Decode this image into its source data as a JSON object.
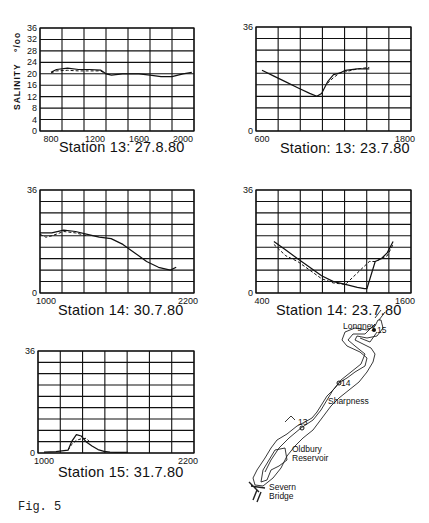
{
  "figure_caption": "Fig. 5",
  "y_axis_label": "SALINITY ‰o",
  "y_axis_unit": "o/oo",
  "chart_data": [
    {
      "type": "line",
      "title": "Station 13: 27.8.80",
      "ylabel": "SALINITY o/oo",
      "xlabel": "",
      "ylim": [
        0,
        36
      ],
      "yticks": [
        0,
        4,
        8,
        12,
        16,
        20,
        24,
        28,
        32,
        36
      ],
      "xlim": [
        700,
        2100
      ],
      "xticks": [
        800,
        1200,
        1600,
        2000
      ],
      "grid": true,
      "series": [
        {
          "name": "solid",
          "x": [
            800,
            850,
            950,
            1050,
            1150,
            1250,
            1300,
            1350,
            1450,
            1600,
            1700,
            1800,
            1900,
            2000,
            2080
          ],
          "y": [
            20.5,
            21.5,
            22,
            21.5,
            21.5,
            21.3,
            20,
            19.5,
            20,
            20,
            19.5,
            19,
            19,
            20,
            20.5
          ]
        },
        {
          "name": "dashed",
          "x": [
            800,
            850,
            950,
            1050,
            1150,
            1250,
            1300
          ],
          "y": [
            20.3,
            21,
            21.2,
            21,
            21,
            21,
            20
          ]
        }
      ]
    },
    {
      "type": "line",
      "title": "Station: 13: 23.7.80",
      "ylim": [
        0,
        36
      ],
      "yticks": [
        0,
        36
      ],
      "xlim": [
        550,
        1850
      ],
      "xticks": [
        600,
        1800
      ],
      "grid": true,
      "series": [
        {
          "name": "solid",
          "x": [
            600,
            700,
            800,
            900,
            1000,
            1060,
            1100,
            1150,
            1200,
            1250,
            1300,
            1400,
            1500
          ],
          "y": [
            21,
            19,
            17,
            15,
            13,
            12,
            13,
            17,
            19.5,
            20,
            21,
            21.5,
            21.5
          ]
        },
        {
          "name": "dashed",
          "x": [
            1150,
            1200,
            1250,
            1300,
            1400,
            1500
          ],
          "y": [
            16.5,
            18.5,
            20,
            20.5,
            21.5,
            22
          ]
        }
      ]
    },
    {
      "type": "line",
      "title": "Station 14: 30.7.80",
      "ylim": [
        0,
        36
      ],
      "yticks": [
        0,
        36
      ],
      "xlim": [
        950,
        2250
      ],
      "xticks": [
        1000,
        2200
      ],
      "grid": true,
      "series": [
        {
          "name": "solid",
          "x": [
            950,
            1050,
            1150,
            1250,
            1350,
            1450,
            1550,
            1650,
            1750,
            1850,
            1950,
            2050,
            2100
          ],
          "y": [
            21,
            21,
            22,
            21.5,
            20.5,
            19.5,
            19,
            17,
            14,
            11,
            9,
            8,
            9
          ]
        },
        {
          "name": "dashed",
          "x": [
            950,
            1000,
            1050,
            1150,
            1250,
            1350
          ],
          "y": [
            20.5,
            19.5,
            20,
            21.5,
            21,
            20
          ]
        }
      ]
    },
    {
      "type": "line",
      "title": "Station 14: 23.7.80",
      "ylim": [
        0,
        36
      ],
      "yticks": [
        0,
        36
      ],
      "xlim": [
        350,
        1650
      ],
      "xticks": [
        400,
        1600
      ],
      "grid": true,
      "series": [
        {
          "name": "solid",
          "x": [
            500,
            600,
            700,
            800,
            900,
            1000,
            1100,
            1200,
            1260,
            1280,
            1350,
            1400,
            1450,
            1500
          ],
          "y": [
            18,
            15,
            12,
            9,
            6,
            4,
            3,
            2,
            1.5,
            1.5,
            11,
            12,
            14,
            18
          ]
        },
        {
          "name": "dashed",
          "x": [
            500,
            600,
            700,
            800,
            900,
            1000,
            1100,
            1300,
            1350,
            1400,
            1450,
            1500
          ],
          "y": [
            17,
            13,
            11,
            8,
            5,
            3.5,
            3,
            11,
            11,
            12,
            13,
            17
          ]
        }
      ]
    },
    {
      "type": "line",
      "title": "Station 15: 31.7.80",
      "ylim": [
        0,
        36
      ],
      "yticks": [
        0,
        36
      ],
      "xlim": [
        950,
        2250
      ],
      "xticks": [
        1000,
        2200
      ],
      "grid": true,
      "series": [
        {
          "name": "solid",
          "x": [
            1000,
            1100,
            1200,
            1230,
            1270,
            1310,
            1350,
            1400,
            1450,
            1500,
            1550,
            1600,
            1700
          ],
          "y": [
            0.3,
            0.5,
            1,
            4,
            6.5,
            6,
            4,
            2.5,
            1.2,
            0.6,
            0.3,
            0.2,
            0.2
          ]
        },
        {
          "name": "dashed",
          "x": [
            1200,
            1230,
            1270,
            1310,
            1350,
            1380
          ],
          "y": [
            1,
            3,
            4.5,
            5,
            5.2,
            4
          ]
        }
      ]
    }
  ],
  "map": {
    "labels": {
      "longney": "Longney",
      "station15": "15",
      "station14": "14",
      "sharpness": "Sharpness",
      "station13": "13",
      "oldbury": "Oldbury",
      "reservoir": "Reservoir",
      "severn": "Severn",
      "bridge": "Bridge"
    }
  }
}
